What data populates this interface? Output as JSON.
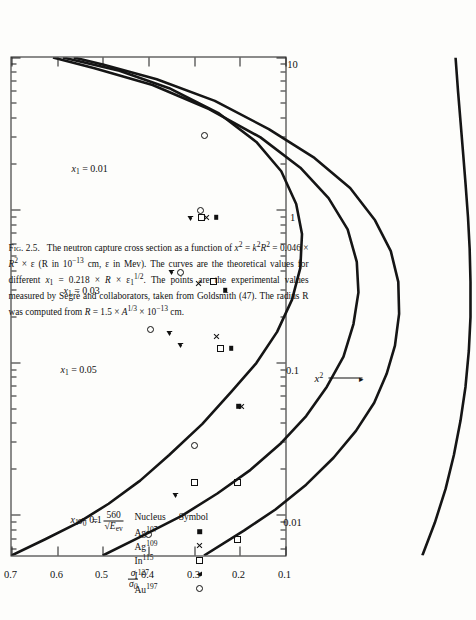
{
  "figure": {
    "number": "Fig. 2.5.",
    "caption_parts": [
      "The neutron capture cross section as a function of ",
      " (R in 10",
      " cm, ε in Mev).  The curves are the theoretical values for different ",
      ".  The points are the experimental values measured by Segrè and collaborators, taken from Goldsmith (47).  The radius R was computed from ",
      " cm."
    ],
    "caption_full": "Fig. 2.5.   The neutron capture cross section as a function of x² = k²R² = 0.046 × R² × ε (R in 10⁻¹³ cm, ε in Mev).   The curves are the theoretical values for different x₁ = 0.218 × R × ε₁^(1/2).   The points are the experimental values measured by Segrè and collaborators, taken from Goldsmith (47).   The radius R was computed from R = 1.5 × A^(1/3) × 10⁻¹³ cm."
  },
  "legend": {
    "header_nucleus": "Nucleus",
    "header_symbol": "Symbol",
    "rows": [
      {
        "nucleus_base": "Ag",
        "nucleus_sup": "107",
        "symbol": "filled-square"
      },
      {
        "nucleus_base": "Ag",
        "nucleus_sup": "109",
        "symbol": "cross"
      },
      {
        "nucleus_base": "In",
        "nucleus_sup": "115",
        "symbol": "open-square"
      },
      {
        "nucleus_base": "I",
        "nucleus_sup": "127",
        "symbol": "open-triangle"
      },
      {
        "nucleus_base": "Au",
        "nucleus_sup": "197",
        "symbol": "open-circle"
      }
    ]
  },
  "sigma_formula": {
    "sigma0": "σ₀",
    "equals": "=",
    "numerator": "560",
    "denominator": "√E_ev",
    "text": "σ₀ = 560 / √E_ev"
  },
  "chart_data": {
    "type": "line",
    "xlabel": "x²",
    "ylabel": "σ/σ₀",
    "xscale": "log",
    "yscale": "linear",
    "xlim": [
      0.0055,
      10
    ],
    "ylim": [
      0.1,
      0.7
    ],
    "xticks": [
      0.01,
      0.1,
      1,
      10
    ],
    "xtick_labels": [
      "0.01",
      "0.1",
      "1",
      "10"
    ],
    "yticks": [
      0.1,
      0.2,
      0.3,
      0.4,
      0.5,
      0.6,
      0.7
    ],
    "ytick_labels": [
      "0.1",
      "0.2",
      "0.3",
      "0.4",
      "0.5",
      "0.6",
      "0.7"
    ],
    "grid": false,
    "legend_position": "upper-left-inside",
    "series": [
      {
        "name": "x₁ = 0.1",
        "label": "x1 = 0.1",
        "style": "solid",
        "annotation": "x₁ = 0.1",
        "points": [
          [
            0.0055,
            0.7
          ],
          [
            0.007,
            0.66
          ],
          [
            0.009,
            0.62
          ],
          [
            0.012,
            0.583
          ],
          [
            0.017,
            0.545
          ],
          [
            0.025,
            0.51
          ],
          [
            0.04,
            0.47
          ],
          [
            0.065,
            0.435
          ],
          [
            0.1,
            0.405
          ],
          [
            0.16,
            0.38
          ],
          [
            0.26,
            0.362
          ],
          [
            0.42,
            0.352
          ],
          [
            0.7,
            0.35
          ],
          [
            1.1,
            0.357
          ],
          [
            1.8,
            0.375
          ],
          [
            2.8,
            0.405
          ],
          [
            4.3,
            0.45
          ],
          [
            6.3,
            0.51
          ],
          [
            8.2,
            0.57
          ],
          [
            10.0,
            0.638
          ]
        ]
      },
      {
        "name": "x₁ = 0.05",
        "label": "x1 = 0.05",
        "style": "solid",
        "annotation": "x₁ = 0.05",
        "points": [
          [
            0.0055,
            0.59
          ],
          [
            0.0075,
            0.54
          ],
          [
            0.01,
            0.495
          ],
          [
            0.014,
            0.452
          ],
          [
            0.02,
            0.412
          ],
          [
            0.03,
            0.375
          ],
          [
            0.045,
            0.345
          ],
          [
            0.07,
            0.32
          ],
          [
            0.11,
            0.3
          ],
          [
            0.18,
            0.288
          ],
          [
            0.29,
            0.282
          ],
          [
            0.46,
            0.284
          ],
          [
            0.75,
            0.295
          ],
          [
            1.2,
            0.318
          ],
          [
            1.9,
            0.352
          ],
          [
            3.0,
            0.4
          ],
          [
            4.6,
            0.462
          ],
          [
            6.6,
            0.53
          ],
          [
            8.5,
            0.6
          ],
          [
            10.0,
            0.65
          ]
        ]
      },
      {
        "name": "x₁ = 0.03",
        "label": "x1 = 0.03",
        "style": "solid",
        "annotation": "x₁ = 0.03",
        "points": [
          [
            0.0055,
            0.468
          ],
          [
            0.008,
            0.42
          ],
          [
            0.011,
            0.382
          ],
          [
            0.016,
            0.345
          ],
          [
            0.024,
            0.312
          ],
          [
            0.036,
            0.285
          ],
          [
            0.055,
            0.263
          ],
          [
            0.085,
            0.248
          ],
          [
            0.13,
            0.238
          ],
          [
            0.21,
            0.233
          ],
          [
            0.34,
            0.234
          ],
          [
            0.54,
            0.243
          ],
          [
            0.86,
            0.262
          ],
          [
            1.4,
            0.292
          ],
          [
            2.2,
            0.335
          ],
          [
            3.4,
            0.39
          ],
          [
            5.2,
            0.455
          ],
          [
            7.2,
            0.525
          ],
          [
            9.0,
            0.59
          ],
          [
            10.0,
            0.625
          ]
        ]
      },
      {
        "name": "x₁ = 0.01",
        "label": "x1 = 0.01",
        "style": "solid",
        "annotation": "x₁ = 0.01",
        "points": [
          [
            0.0055,
            0.205
          ],
          [
            0.009,
            0.19
          ],
          [
            0.015,
            0.177
          ],
          [
            0.025,
            0.167
          ],
          [
            0.042,
            0.159
          ],
          [
            0.07,
            0.153
          ],
          [
            0.12,
            0.149
          ],
          [
            0.2,
            0.147
          ],
          [
            0.34,
            0.147
          ],
          [
            0.56,
            0.148
          ],
          [
            0.9,
            0.15
          ],
          [
            1.5,
            0.153
          ],
          [
            2.4,
            0.156
          ],
          [
            3.8,
            0.159
          ],
          [
            6.0,
            0.162
          ],
          [
            10.0,
            0.165
          ]
        ]
      }
    ],
    "scatter": [
      {
        "nucleus": "Ag107",
        "symbol": "filled-square",
        "points": [
          [
            0.052,
            0.203
          ],
          [
            0.125,
            0.219
          ],
          [
            0.3,
            0.232
          ],
          [
            0.9,
            0.252
          ]
        ]
      },
      {
        "nucleus": "Ag109",
        "symbol": "cross",
        "points": [
          [
            0.052,
            0.196
          ],
          [
            0.15,
            0.251
          ],
          [
            0.33,
            0.29
          ],
          [
            0.9,
            0.272
          ]
        ]
      },
      {
        "nucleus": "In115",
        "symbol": "open-square",
        "points": [
          [
            0.007,
            0.205
          ],
          [
            0.0165,
            0.205
          ],
          [
            0.125,
            0.243
          ],
          [
            0.34,
            0.258
          ],
          [
            0.9,
            0.285
          ],
          [
            0.0165,
            0.3
          ]
        ]
      },
      {
        "nucleus": "I127",
        "symbol": "open-triangle",
        "points": [
          [
            0.0135,
            0.34
          ],
          [
            0.13,
            0.33
          ],
          [
            0.155,
            0.355
          ],
          [
            0.39,
            0.35
          ],
          [
            0.88,
            0.308
          ]
        ]
      },
      {
        "nucleus": "Au197",
        "symbol": "open-circle",
        "points": [
          [
            0.0075,
            0.4
          ],
          [
            0.165,
            0.396
          ],
          [
            0.39,
            0.33
          ],
          [
            1.0,
            0.287
          ],
          [
            3.1,
            0.278
          ],
          [
            0.029,
            0.3
          ]
        ]
      }
    ],
    "curve_annotations": [
      {
        "text": "x₁ = 0.1",
        "x_frac": 0.085,
        "y_frac": 0.215
      },
      {
        "text": "x₁ = 0.05",
        "x_frac": 0.385,
        "y_frac": 0.18
      },
      {
        "text": "x₁ = 0.03",
        "x_frac": 0.545,
        "y_frac": 0.19
      },
      {
        "text": "x₁ = 0.01",
        "x_frac": 0.79,
        "y_frac": 0.218
      }
    ]
  }
}
